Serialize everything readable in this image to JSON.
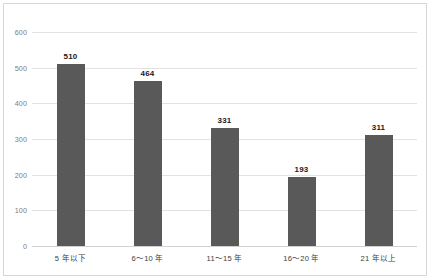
{
  "chart_data": {
    "type": "bar",
    "title": "",
    "subtitle": "",
    "xlabel": "",
    "ylabel": "",
    "categories": [
      "5 年以下",
      "6〜10 年",
      "11〜15 年",
      "16〜20 年",
      "21 年以上"
    ],
    "values": [
      510,
      464,
      331,
      193,
      311
    ],
    "value_labels": [
      "510",
      "464",
      "331",
      "193",
      "311"
    ],
    "ylim": [
      0,
      600
    ],
    "yticks": [
      0,
      100,
      200,
      300,
      400,
      500,
      600
    ],
    "ytick_labels": [
      "0",
      "100",
      "200",
      "300",
      "400",
      "500",
      "600"
    ],
    "grid": true,
    "grid_axis": "y",
    "legend": false,
    "legend_position": "none",
    "series": [
      {
        "name": "",
        "values": [
          510,
          464,
          331,
          193,
          311
        ]
      }
    ],
    "colors": {
      "bar": "#595959",
      "gridline": "#e2e2e2",
      "axis": "#d2d2d2",
      "value_label": "#1a1a1a",
      "tick_label": "#7d7d7d",
      "category_label": "#3d3d3d",
      "frame_border": "#d7d7d7",
      "background": "#ffffff"
    }
  }
}
